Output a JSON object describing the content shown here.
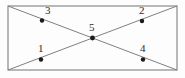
{
  "figure": {
    "canvas": {
      "width": 185,
      "height": 78
    },
    "background_color": "#fdfdfd",
    "line_color": "#808080",
    "rectangle_stroke_color": "#8a8a8a",
    "label_color": "#2b2b2b",
    "dot_color": "#1a1a1a",
    "rectangle": {
      "name": "outer-rectangle",
      "x": 8,
      "y": 6,
      "width": 169,
      "height": 64,
      "stroke_width": 1.2
    },
    "diagonals": [
      {
        "name": "diagonal-top-left-to-bottom-right",
        "x1": 8,
        "y1": 6,
        "x2": 177,
        "y2": 70,
        "stroke_width": 1
      },
      {
        "name": "diagonal-bottom-left-to-top-right",
        "x1": 8,
        "y1": 70,
        "x2": 177,
        "y2": 6,
        "stroke_width": 1
      }
    ],
    "points": [
      {
        "id": "point-1",
        "label": "1",
        "cx": 41,
        "cy": 59.5,
        "r": 2.2,
        "label_x": 38,
        "label_y": 52,
        "on_line": "diagonal-bottom-left-to-top-right"
      },
      {
        "id": "point-2",
        "label": "2",
        "cx": 142,
        "cy": 21,
        "r": 2.2,
        "label_x": 139,
        "label_y": 14,
        "on_line": "diagonal-bottom-left-to-top-right"
      },
      {
        "id": "point-3",
        "label": "3",
        "cx": 42,
        "cy": 20.5,
        "r": 2.2,
        "label_x": 45,
        "label_y": 14,
        "on_line": "diagonal-top-left-to-bottom-right"
      },
      {
        "id": "point-4",
        "label": "4",
        "cx": 143,
        "cy": 59.5,
        "r": 2.2,
        "label_x": 140,
        "label_y": 52,
        "on_line": "diagonal-top-left-to-bottom-right"
      },
      {
        "id": "point-5",
        "label": "5",
        "cx": 92.5,
        "cy": 38,
        "r": 2.4,
        "label_x": 89,
        "label_y": 31,
        "on_line": "diagonal-intersection"
      }
    ]
  }
}
